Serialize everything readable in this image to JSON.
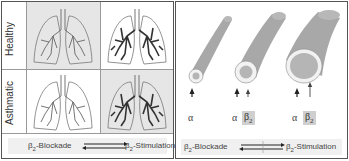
{
  "left_panel": {
    "rows": [
      {
        "label": "Healthy"
      },
      {
        "label": "Asthmatic"
      }
    ],
    "cells": [
      {
        "row": "Healthy",
        "col": 1,
        "shade": "grey",
        "airway_intensity": "light"
      },
      {
        "row": "Healthy",
        "col": 2,
        "shade": "white",
        "airway_intensity": "dark"
      },
      {
        "row": "Asthmatic",
        "col": 1,
        "shade": "white",
        "airway_intensity": "light"
      },
      {
        "row": "Asthmatic",
        "col": 2,
        "shade": "grey",
        "airway_intensity": "dark"
      }
    ],
    "footer": {
      "left_prefix": "β",
      "left_sub": "2",
      "left_suffix": "-Blockade",
      "right_prefix": "β",
      "right_sub": "2",
      "right_suffix": "-Stimulation"
    }
  },
  "right_panel": {
    "tubes": [
      {
        "size": "narrow",
        "labels": [
          {
            "text": "α",
            "boxed": false
          }
        ]
      },
      {
        "size": "medium",
        "labels": [
          {
            "text": "α",
            "boxed": false
          },
          {
            "text": "β",
            "sub": "2",
            "boxed": true
          }
        ]
      },
      {
        "size": "wide",
        "labels": [
          {
            "text": "α",
            "boxed": false
          },
          {
            "text": "β",
            "sub": "2",
            "boxed": true
          }
        ]
      }
    ],
    "alpha_1": "α",
    "alpha_2": "α",
    "alpha_3": "α",
    "beta_2": "β",
    "beta_2_sub": "2",
    "beta_3": "β",
    "beta_3_sub": "2",
    "footer": {
      "left_prefix": "β",
      "left_sub": "2",
      "left_suffix": "-Blockade",
      "right_prefix": "β",
      "right_sub": "2",
      "right_suffix": "-Stimulation"
    }
  },
  "colors": {
    "border": "#555555",
    "cell_grey": "#e6e6e6",
    "tube_fill": "#a8a8a8",
    "tube_rim": "#f2f2f2",
    "beta_box": "#cfcfcf",
    "arrow": "#222222"
  }
}
